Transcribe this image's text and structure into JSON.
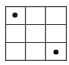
{
  "board": {
    "rows": 3,
    "cols": 3,
    "line_color": "#555555",
    "piece_color": "#111111",
    "cells": [
      [
        "dot",
        "",
        ""
      ],
      [
        "",
        "",
        ""
      ],
      [
        "",
        "",
        "dot"
      ]
    ]
  }
}
